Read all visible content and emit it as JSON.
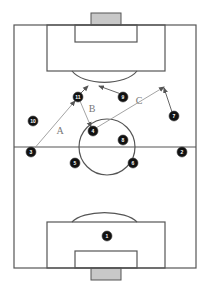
{
  "diagram": {
    "type": "football-tactics",
    "pitch": {
      "x": 14,
      "y": 25,
      "w": 182,
      "h": 243,
      "line_color": "#555555"
    },
    "goal_fill": "#c8c8c8",
    "player_fill": "#111111",
    "players": [
      {
        "number": "1",
        "x": 107,
        "y": 236
      },
      {
        "number": "2",
        "x": 182,
        "y": 152
      },
      {
        "number": "3",
        "x": 31,
        "y": 152
      },
      {
        "number": "4",
        "x": 93,
        "y": 131
      },
      {
        "number": "5",
        "x": 75,
        "y": 163
      },
      {
        "number": "6",
        "x": 133,
        "y": 163
      },
      {
        "number": "7",
        "x": 174,
        "y": 116
      },
      {
        "number": "8",
        "x": 123,
        "y": 140
      },
      {
        "number": "9",
        "x": 123,
        "y": 97
      },
      {
        "number": "10",
        "x": 33,
        "y": 121
      },
      {
        "number": "11",
        "x": 78,
        "y": 97
      }
    ],
    "passes": [
      {
        "label": "A",
        "from": [
          33,
          150
        ],
        "to": [
          75,
          101
        ],
        "label_pos": [
          60,
          130
        ]
      },
      {
        "label": "B",
        "from": [
          80,
          101
        ],
        "to": [
          91,
          127
        ],
        "label_pos": [
          92,
          108
        ]
      },
      {
        "label": "C",
        "from": [
          96,
          128
        ],
        "to": [
          164,
          87
        ],
        "label_pos": [
          139,
          100
        ]
      }
    ],
    "runs": [
      {
        "from": [
          121,
          94
        ],
        "to": [
          99,
          86
        ]
      },
      {
        "from": [
          80,
          94
        ],
        "to": [
          88,
          86
        ]
      },
      {
        "from": [
          172,
          112
        ],
        "to": [
          164,
          88
        ]
      }
    ]
  }
}
